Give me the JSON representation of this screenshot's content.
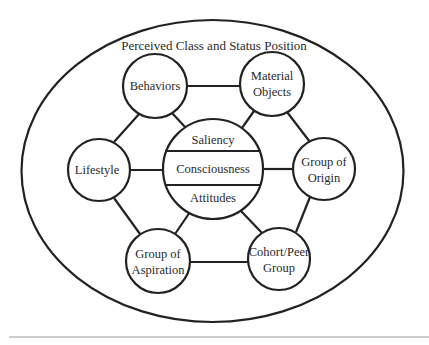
{
  "diagram": {
    "title": "Perceived Class and Status Position",
    "colors": {
      "stroke": "#222222",
      "text": "#2a2a2a",
      "divider": "#9a9a9a",
      "background": "#ffffff"
    },
    "center_node": {
      "sections": [
        "Saliency",
        "Consciousness",
        "Attitudes"
      ]
    },
    "nodes": [
      {
        "id": "behaviors",
        "lines": [
          "Behaviors"
        ]
      },
      {
        "id": "material-objects",
        "lines": [
          "Material",
          "Objects"
        ]
      },
      {
        "id": "lifestyle",
        "lines": [
          "Lifestyle"
        ]
      },
      {
        "id": "group-of-origin",
        "lines": [
          "Group of",
          "Origin"
        ]
      },
      {
        "id": "group-of-aspiration",
        "lines": [
          "Group of",
          "Aspiration"
        ]
      },
      {
        "id": "cohort-peer-group",
        "lines": [
          "Cohort/Peer",
          "Group"
        ]
      }
    ],
    "edges": [
      [
        "behaviors",
        "material-objects"
      ],
      [
        "behaviors",
        "lifestyle"
      ],
      [
        "behaviors",
        "center"
      ],
      [
        "material-objects",
        "group-of-origin"
      ],
      [
        "material-objects",
        "center"
      ],
      [
        "lifestyle",
        "center"
      ],
      [
        "lifestyle",
        "group-of-aspiration"
      ],
      [
        "group-of-origin",
        "center"
      ],
      [
        "group-of-origin",
        "cohort-peer-group"
      ],
      [
        "group-of-aspiration",
        "cohort-peer-group"
      ],
      [
        "group-of-aspiration",
        "center"
      ],
      [
        "cohort-peer-group",
        "center"
      ]
    ]
  }
}
